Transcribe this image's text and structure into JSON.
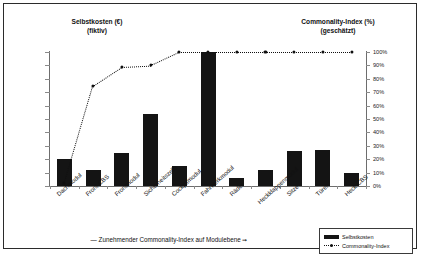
{
  "titles": {
    "left": "Selbstkosten (€)\n(fiktiv)",
    "right": "Commonality-Index (%)\n(geschätzt)"
  },
  "annotation": {
    "dash": "—",
    "text": "Zunehmender Commonality-Index auf Modulebene",
    "arrow": "➞"
  },
  "legend": {
    "items": [
      {
        "label": "Selbstkosten",
        "marker": "bar-swatch"
      },
      {
        "label": "Commonality-Index",
        "marker": "dotted-line-swatch"
      }
    ]
  },
  "chart_data": {
    "type": "bar",
    "title": "",
    "xlabel": "",
    "ylabel": "Selbstkosten (€)",
    "y2label": "Commonality-Index (%)",
    "categories": [
      "Dachmodul",
      "Front-CBS",
      "Frontmodul",
      "Sicherheitszelle",
      "Cockpitmodul",
      "Fahrwerkmodul",
      "Räder",
      "Heckklappenmodul",
      "Sitze",
      "Türen",
      "Heck-CBS"
    ],
    "series": [
      {
        "name": "Selbstkosten",
        "type": "bar",
        "color": "#141414",
        "values": [
          20,
          12,
          25,
          54,
          15,
          100,
          6,
          12,
          26,
          27,
          10
        ]
      },
      {
        "name": "Commonality-Index",
        "type": "line",
        "color": "#111111",
        "style": "dotted",
        "values": [
          2,
          75,
          89,
          90,
          100,
          100,
          100,
          100,
          100,
          100,
          100
        ]
      }
    ],
    "y2ticks": [
      "0%",
      "10%",
      "20%",
      "30%",
      "40%",
      "50%",
      "60%",
      "70%",
      "80%",
      "90%",
      "100%"
    ],
    "y2lim": [
      0,
      100
    ],
    "yticks_left_labeled": false,
    "grid": false,
    "legend_position": "bottom-right"
  }
}
